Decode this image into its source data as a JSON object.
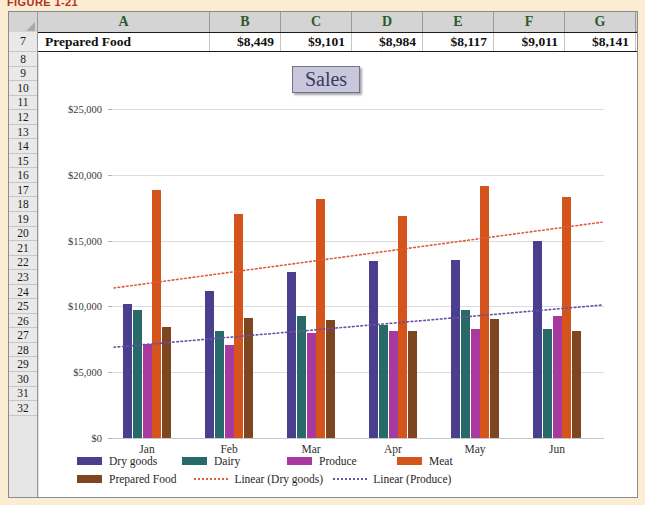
{
  "figure": {
    "caption": "FIGURE 1-21"
  },
  "spreadsheet": {
    "columns": [
      "A",
      "B",
      "C",
      "D",
      "E",
      "F",
      "G"
    ],
    "row_numbers": [
      "7",
      "8",
      "9",
      "10",
      "11",
      "12",
      "13",
      "14",
      "15",
      "16",
      "17",
      "18",
      "19",
      "20",
      "21",
      "22",
      "23",
      "24",
      "25",
      "26",
      "27",
      "28",
      "29",
      "30",
      "31",
      "32"
    ],
    "row7": {
      "label": "Prepared Food",
      "values": [
        "$8,449",
        "$9,101",
        "$8,984",
        "$8,117",
        "$9,011",
        "$8,141"
      ]
    },
    "select_all_icon": "select-all-triangle"
  },
  "chart_data": {
    "type": "bar",
    "title": "Sales",
    "xlabel": "",
    "ylabel": "",
    "categories": [
      "Jan",
      "Feb",
      "Mar",
      "Apr",
      "May",
      "Jun"
    ],
    "ylim": [
      0,
      25000
    ],
    "ytick_labels": [
      "$0",
      "$5,000",
      "$10,000",
      "$15,000",
      "$20,000",
      "$25,000"
    ],
    "ytick_values": [
      0,
      5000,
      10000,
      15000,
      20000,
      25000
    ],
    "grid": true,
    "legend_position": "bottom",
    "series": [
      {
        "name": "Dry goods",
        "color": "#4a3f8f",
        "values": [
          10200,
          11150,
          12650,
          13450,
          13500,
          15000
        ]
      },
      {
        "name": "Dairy",
        "color": "#286a6a",
        "values": [
          9700,
          8150,
          9250,
          8600,
          9750,
          8300
        ]
      },
      {
        "name": "Produce",
        "color": "#a8399f",
        "values": [
          7150,
          7100,
          7950,
          8150,
          8250,
          9250
        ]
      },
      {
        "name": "Meat",
        "color": "#d4541c",
        "values": [
          18850,
          17050,
          18150,
          16850,
          19150,
          18300
        ]
      },
      {
        "name": "Prepared Food",
        "color": "#7d4520",
        "values": [
          8449,
          9101,
          8984,
          8117,
          9011,
          8141
        ]
      }
    ],
    "trendlines": [
      {
        "name": "Linear (Dry goods)",
        "color": "#e05a3c",
        "style": "dotted",
        "y_start": 11400,
        "y_end": 16400
      },
      {
        "name": "Linear (Produce)",
        "color": "#6b4fa8",
        "style": "dotted",
        "y_start": 6900,
        "y_end": 10100
      }
    ],
    "legend": [
      {
        "label": "Dry goods",
        "color": "#4a3f8f",
        "marker": "swatch"
      },
      {
        "label": "Dairy",
        "color": "#286a6a",
        "marker": "swatch"
      },
      {
        "label": "Produce",
        "color": "#a8399f",
        "marker": "swatch"
      },
      {
        "label": "Meat",
        "color": "#d4541c",
        "marker": "swatch"
      },
      {
        "label": "Prepared Food",
        "color": "#7d4520",
        "marker": "swatch"
      },
      {
        "label": "Linear (Dry goods)",
        "color": "#e05a3c",
        "marker": "dotted-line"
      },
      {
        "label": "Linear (Produce)",
        "color": "#6b4fa8",
        "marker": "dotted-line"
      }
    ]
  }
}
